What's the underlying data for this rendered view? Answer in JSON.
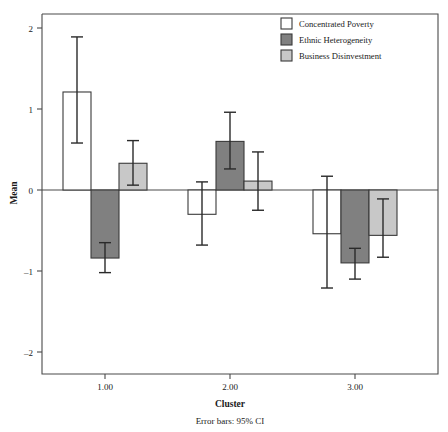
{
  "chart_data": {
    "type": "bar",
    "title": "",
    "subtitle": "",
    "xlabel": "Cluster",
    "ylabel": "Mean",
    "categories": [
      "1.00",
      "2.00",
      "3.00"
    ],
    "ylim": [
      -2.2,
      2.15
    ],
    "yticks": [
      2,
      1,
      0,
      -1,
      -2
    ],
    "ytick_labels": [
      "2",
      "1",
      "0",
      "–1",
      "–2"
    ],
    "grid": false,
    "legend_position": "top-right",
    "error_bars_note": "Error bars: 95% CI",
    "series": [
      {
        "name": "Concentrated Poverty",
        "color": "#ffffff",
        "values": [
          1.21,
          -0.3,
          -0.54
        ],
        "ci_low": [
          0.58,
          -0.68,
          -1.21
        ],
        "ci_high": [
          1.89,
          0.1,
          0.17
        ]
      },
      {
        "name": "Ethnic Heterogeneity",
        "color": "#808080",
        "values": [
          -0.84,
          0.6,
          -0.9
        ],
        "ci_low": [
          -1.02,
          0.26,
          -1.1
        ],
        "ci_high": [
          -0.65,
          0.96,
          -0.72
        ]
      },
      {
        "name": "Business Disinvestment",
        "color": "#c8c8c8",
        "values": [
          0.33,
          0.11,
          -0.56
        ],
        "ci_low": [
          0.06,
          -0.25,
          -0.83
        ],
        "ci_high": [
          0.61,
          0.47,
          -0.11
        ]
      }
    ]
  },
  "axes": {
    "y_title": "Mean",
    "x_title": "Cluster",
    "y_tick_2": "2",
    "y_tick_1": "1",
    "y_tick_0": "0",
    "y_tick_m1": "–1",
    "y_tick_m2": "–2",
    "x_tick_1": "1.00",
    "x_tick_2": "2.00",
    "x_tick_3": "3.00"
  },
  "legend": {
    "items": [
      {
        "label": "Concentrated Poverty",
        "color": "#ffffff"
      },
      {
        "label": "Ethnic Heterogeneity",
        "color": "#808080"
      },
      {
        "label": "Business Disinvestment",
        "color": "#c8c8c8"
      }
    ]
  },
  "footnote": {
    "text": "Error bars: 95% CI"
  },
  "colors": {
    "series1": "#ffffff",
    "series2": "#808080",
    "series3": "#c8c8c8",
    "axis": "#4a4a4a",
    "ink": "#1a1a1a"
  }
}
